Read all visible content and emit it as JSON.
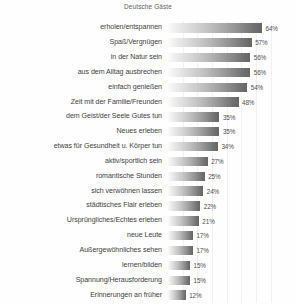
{
  "chart_data": {
    "type": "bar",
    "orientation": "horizontal",
    "title": "Deutsche Gäste",
    "xlabel": "",
    "ylabel": "",
    "xlim": [
      0,
      70
    ],
    "grid": true,
    "grid_axis": "x",
    "legend": false,
    "value_suffix": "%",
    "bar_style": "horizontal-gradient-grayscale",
    "categories": [
      "erholen/entspannen",
      "Spaß/Vergnügen",
      "in der Natur sein",
      "aus dem Alltag ausbrechen",
      "einfach genießen",
      "Zeit mit der Familie/Freunden",
      "dem Geist/der Seele Gutes tun",
      "Neues erleben",
      "etwas für Gesundheit u. Körper tun",
      "aktiv/sportlich sein",
      "romantische Stunden",
      "sich verwöhnen lassen",
      "städtisches Flair erleben",
      "Ursprüngliches/Echtes erleben",
      "neue Leute",
      "Außergewöhnliches sehen",
      "lernen/bilden",
      "Spannung/Herausforderung",
      "Erinnerungen an früher"
    ],
    "values": [
      64,
      57,
      56,
      56,
      54,
      48,
      35,
      35,
      34,
      27,
      25,
      24,
      22,
      21,
      17,
      17,
      15,
      15,
      12
    ],
    "value_labels": [
      "64%",
      "57%",
      "56%",
      "56%",
      "54%",
      "48%",
      "35%",
      "35%",
      "34%",
      "27%",
      "25%",
      "24%",
      "22%",
      "21%",
      "17%",
      "17%",
      "15%",
      "15%",
      "12%"
    ],
    "colors": {
      "bar_gradient_start": "#fbfbfb",
      "bar_gradient_end": "#636363",
      "gridline": "#f1f1f1",
      "label_text": "#3b3b3b",
      "value_text": "#4a4a4a",
      "title_text": "#5d5d5d",
      "background": "#fefefe"
    }
  }
}
